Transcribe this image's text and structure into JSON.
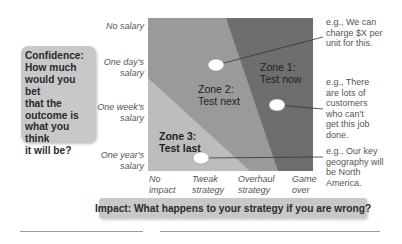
{
  "y_axis": {
    "title": "Confidence: How much would you bet that the outcome is what you think it will be?",
    "title_lines": [
      "Confidence:",
      "How much",
      "would you bet",
      "that the",
      "outcome is",
      "what you think",
      "it will be?"
    ],
    "ticks": [
      {
        "lines": [
          "No salary"
        ]
      },
      {
        "lines": [
          "One day's",
          "salary"
        ]
      },
      {
        "lines": [
          "One week's",
          "salary"
        ]
      },
      {
        "lines": [
          "One year's",
          "salary"
        ]
      }
    ]
  },
  "x_axis": {
    "title": "Impact: What happens to your strategy if you are wrong?",
    "ticks": [
      {
        "lines": [
          "No",
          "impact"
        ]
      },
      {
        "lines": [
          "Tweak",
          "strategy"
        ]
      },
      {
        "lines": [
          "Overhaul",
          "strategy"
        ]
      },
      {
        "lines": [
          "Game",
          "over"
        ]
      }
    ]
  },
  "zones": [
    {
      "id": "zone1",
      "title": "Zone 1:",
      "subtitle": "Test now",
      "color": "#6e6e6e"
    },
    {
      "id": "zone2",
      "title": "Zone 2:",
      "subtitle": "Test next",
      "color": "#9a9a9a"
    },
    {
      "id": "zone3",
      "title": "Zone 3:",
      "subtitle": "Test last",
      "color": "#bdbdbd"
    }
  ],
  "callouts": [
    {
      "lines": [
        "e.g., We can",
        "charge $X per",
        "unit for this."
      ]
    },
    {
      "lines": [
        "e.g., There",
        "are lots of",
        "customers",
        "who can't",
        "get this job",
        "done."
      ]
    },
    {
      "lines": [
        "e.g., Our key",
        "geography will",
        "be North",
        "America."
      ]
    }
  ],
  "colors": {
    "box_fill": "#c8c8c8",
    "zone1": "#6e6e6e",
    "zone2": "#9a9a9a",
    "zone3": "#bdbdbd",
    "dot": "#ffffff",
    "leader": "#333333"
  }
}
